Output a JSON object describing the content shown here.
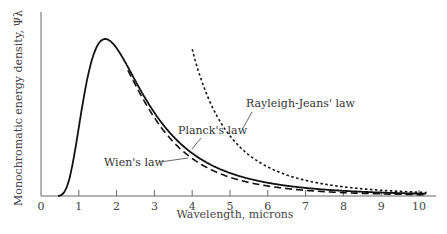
{
  "chart_data": {
    "type": "line",
    "title": "",
    "xlabel": "Wavelength, microns",
    "ylabel": "Monochromatic energy density, Ψλ",
    "xlim": [
      0,
      10.4
    ],
    "ylim": [
      0,
      1.1
    ],
    "grid": false,
    "legend": "annotations",
    "x_ticks": [
      "0",
      "1",
      "2",
      "3",
      "4",
      "5",
      "6",
      "7",
      "8",
      "9",
      "10"
    ],
    "x": [
      0.5,
      1,
      1.5,
      1.7,
      2,
      2.5,
      3,
      4,
      5,
      6,
      7,
      8,
      9,
      10
    ],
    "series": [
      {
        "name": "Planck's law",
        "style": "solid",
        "values": [
          0.02,
          0.35,
          0.96,
          1.0,
          0.95,
          0.76,
          0.58,
          0.3,
          0.16,
          0.095,
          0.06,
          0.04,
          0.028,
          0.02
        ]
      },
      {
        "name": "Wien's law",
        "style": "dashed",
        "values": [
          0.02,
          0.35,
          0.96,
          1.0,
          0.94,
          0.73,
          0.53,
          0.24,
          0.11,
          0.055,
          0.03,
          0.018,
          0.011,
          0.007
        ]
      },
      {
        "name": "Rayleigh-Jeans' law",
        "style": "dotted",
        "values": [
          null,
          null,
          null,
          null,
          null,
          null,
          null,
          1.15,
          0.48,
          0.25,
          0.15,
          0.095,
          0.065,
          0.046
        ]
      }
    ],
    "annotations": [
      {
        "text": "Rayleigh-Jeans' law",
        "points_to": "Rayleigh-Jeans' law"
      },
      {
        "text": "Planck's  law",
        "points_to": "Planck's law"
      },
      {
        "text": "Wien's  law",
        "points_to": "Wien's law"
      }
    ]
  }
}
